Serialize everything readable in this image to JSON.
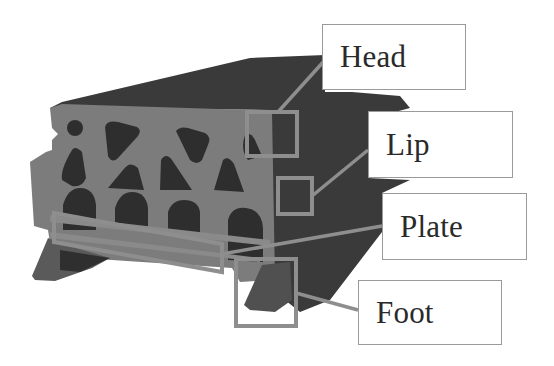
{
  "diagram": {
    "colors": {
      "background": "#ffffff",
      "body_dark": "#3a3a3a",
      "face_gray": "#7c7c7c",
      "hole_dark": "#2e2e2e",
      "highlight": "#8e8e8e",
      "label_border": "#9a9a9a",
      "label_text": "#2a2a2a"
    },
    "labels": [
      {
        "id": "head",
        "text": "Head"
      },
      {
        "id": "lip",
        "text": "Lip"
      },
      {
        "id": "plate",
        "text": "Plate"
      },
      {
        "id": "foot",
        "text": "Foot"
      }
    ]
  }
}
